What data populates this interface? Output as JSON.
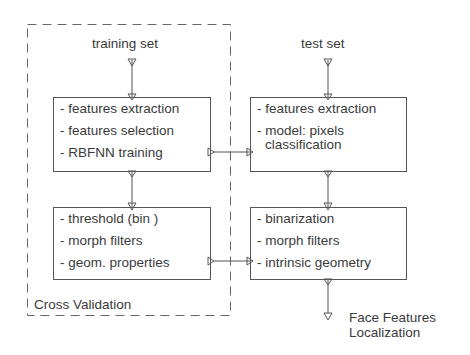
{
  "diagram": {
    "cross_validation": {
      "label": "Cross Validation"
    },
    "training": {
      "input_label": "training set",
      "box1": {
        "lines": [
          "- features extraction",
          "- features selection",
          "- RBFNN training"
        ]
      },
      "box2": {
        "lines": [
          "- threshold (bin )",
          "- morph filters",
          "- geom. properties"
        ]
      }
    },
    "test": {
      "input_label": "test set",
      "box1": {
        "lines": [
          "- features extraction",
          "- model: pixels",
          "classification"
        ]
      },
      "box2": {
        "lines": [
          "- binarization",
          "- morph filters",
          "- intrinsic geometry"
        ]
      }
    },
    "output": {
      "line1": "Face Features",
      "line2": "Localization"
    },
    "colors": {
      "stroke": "#555555",
      "text": "#3a3a3a",
      "background": "#ffffff"
    }
  }
}
